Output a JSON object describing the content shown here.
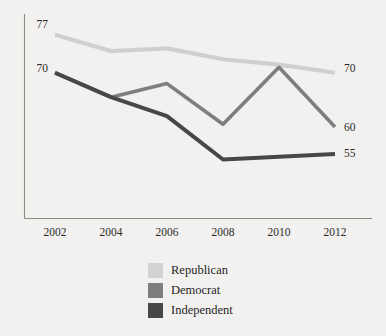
{
  "chart_data": {
    "type": "line",
    "title": "",
    "xlabel": "",
    "ylabel": "",
    "categories": [
      "2002",
      "2004",
      "2006",
      "2008",
      "2010",
      "2012"
    ],
    "x": [
      2002,
      2004,
      2006,
      2008,
      2010,
      2012
    ],
    "xlim": [
      2002,
      2012
    ],
    "ylim": [
      48,
      79
    ],
    "grid": false,
    "legend_position": "bottom-center",
    "series": [
      {
        "name": "Republican",
        "color": "#cfcfcd",
        "values": [
          77,
          74,
          74.5,
          72.5,
          71.5,
          70
        ],
        "start_label": "77",
        "end_label": "70"
      },
      {
        "name": "Democrat",
        "color": "#7e7e7c",
        "values": [
          70,
          65.5,
          68,
          60.5,
          71,
          60
        ],
        "start_label": "70",
        "end_label": "60"
      },
      {
        "name": "Independent",
        "color": "#474747",
        "values": [
          70,
          65.5,
          62,
          54,
          54.5,
          55
        ],
        "start_label": "70",
        "end_label": "55"
      }
    ],
    "left_axis_labels": [
      "77",
      "70"
    ],
    "right_axis_labels": [
      "70",
      "60",
      "55"
    ]
  },
  "legend": {
    "items": [
      {
        "label": "Republican",
        "color": "#d2d2d0"
      },
      {
        "label": "Democrat",
        "color": "#7e7e7c"
      },
      {
        "label": "Independent",
        "color": "#474747"
      }
    ]
  },
  "axis": {
    "tick_labels": [
      "2002",
      "2004",
      "2006",
      "2008",
      "2010",
      "2012"
    ],
    "left_labels": [
      {
        "text": "77",
        "y": 24
      },
      {
        "text": "70",
        "y": 68
      }
    ],
    "right_labels": [
      {
        "text": "70",
        "y": 68
      },
      {
        "text": "60",
        "y": 127
      },
      {
        "text": "55",
        "y": 153
      }
    ]
  }
}
